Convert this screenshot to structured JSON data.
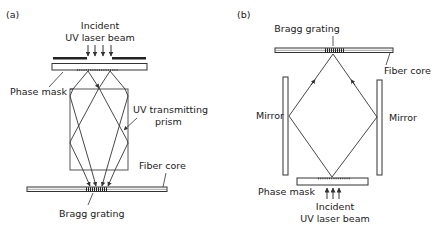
{
  "panel_a": {
    "tag": "(a)",
    "incident_line1": "Incident",
    "incident_line2": "UV laser beam",
    "phase_mask": "Phase mask",
    "prism_line1": "UV transmitting",
    "prism_line2": "prism",
    "fiber_core": "Fiber core",
    "bragg_grating": "Bragg grating"
  },
  "panel_b": {
    "tag": "(b)",
    "bragg_grating": "Bragg grating",
    "fiber_core": "Fiber core",
    "mirror_left": "Mirror",
    "mirror_right": "Mirror",
    "phase_mask": "Phase mask",
    "incident_line1": "Incident",
    "incident_line2": "UV laser beam"
  },
  "colors": {
    "line": "#333333",
    "background": "#ffffff"
  }
}
